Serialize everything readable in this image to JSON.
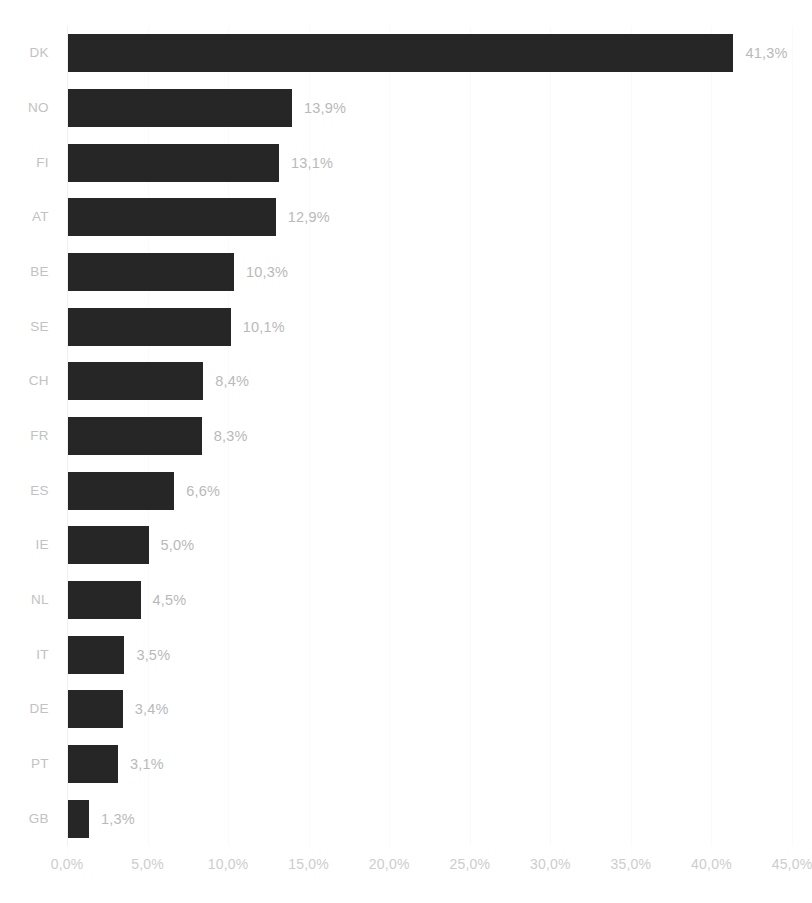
{
  "chart_data": {
    "type": "bar",
    "orientation": "horizontal",
    "title": "",
    "subtitle": "",
    "xlabel": "",
    "ylabel": "",
    "categories": [
      "DK",
      "NO",
      "FI",
      "AT",
      "BE",
      "SE",
      "CH",
      "FR",
      "ES",
      "IE",
      "NL",
      "IT",
      "DE",
      "PT",
      "GB"
    ],
    "values": [
      41.3,
      13.9,
      13.1,
      12.9,
      10.3,
      10.1,
      8.4,
      8.3,
      6.6,
      5.0,
      4.5,
      3.5,
      3.4,
      3.1,
      1.3
    ],
    "value_labels": [
      "41,3%",
      "13,9%",
      "13,1%",
      "12,9%",
      "10,3%",
      "10,1%",
      "8,4%",
      "8,3%",
      "6,6%",
      "5,0%",
      "4,5%",
      "3,5%",
      "3,4%",
      "3,1%",
      "1,3%"
    ],
    "xlim": [
      0,
      45
    ],
    "xticks": [
      0,
      5,
      10,
      15,
      20,
      25,
      30,
      35,
      40,
      45
    ],
    "xtick_labels": [
      "0,0%",
      "5,0%",
      "10,0%",
      "15,0%",
      "20,0%",
      "25,0%",
      "30,0%",
      "35,0%",
      "40,0%",
      "45,0%"
    ],
    "grid": true,
    "grid_axis": "x",
    "legend": false,
    "legend_position": "none",
    "bar_color": "#262626",
    "value_label_color": "#b9b9b9",
    "category_label_color": "#c2c2c2",
    "tick_label_color": "#cdcdcd",
    "gridline_color": "#fafafa",
    "background_color": "#ffffff",
    "decimal_separator": ","
  }
}
